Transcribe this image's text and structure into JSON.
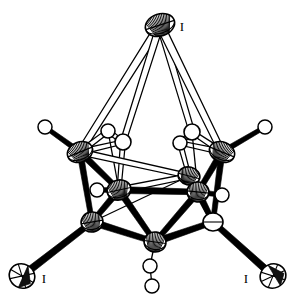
{
  "figure": {
    "background_color": "#ffffff",
    "line_color": "#000000",
    "width": 298,
    "height": 301
  },
  "labels": [
    {
      "id": "label-i-top",
      "text": "I",
      "x": 182,
      "y": 31
    },
    {
      "id": "label-i-bottom-left",
      "text": "I",
      "x": 44,
      "y": 283
    },
    {
      "id": "label-i-bottom-right",
      "text": "I",
      "x": 246,
      "y": 283
    }
  ],
  "atoms": [
    {
      "id": "I1",
      "element": "I",
      "kind": "ellipsoid",
      "x": 160,
      "y": 25,
      "rx": 15,
      "ry": 11,
      "rot": -18,
      "shade": "hatched"
    },
    {
      "id": "I2",
      "element": "I",
      "kind": "ellipsoid",
      "x": 22,
      "y": 276,
      "rx": 13,
      "ry": 12,
      "rot": 30,
      "shade": "quad"
    },
    {
      "id": "I3",
      "element": "I",
      "kind": "ellipsoid",
      "x": 273,
      "y": 276,
      "rx": 13,
      "ry": 12,
      "rot": -25,
      "shade": "quad"
    },
    {
      "id": "B1",
      "element": "B",
      "kind": "ellipsoid",
      "x": 80,
      "y": 152,
      "rx": 13,
      "ry": 10,
      "rot": -22,
      "shade": "hatched"
    },
    {
      "id": "B2",
      "element": "B",
      "kind": "ellipsoid",
      "x": 222,
      "y": 152,
      "rx": 13,
      "ry": 10,
      "rot": 22,
      "shade": "hatched"
    },
    {
      "id": "B3",
      "element": "B",
      "kind": "ellipsoid",
      "x": 119,
      "y": 190,
      "rx": 12,
      "ry": 10,
      "rot": -12,
      "shade": "hatched"
    },
    {
      "id": "B4",
      "element": "B",
      "kind": "ellipsoid",
      "x": 189,
      "y": 176,
      "rx": 11,
      "ry": 9,
      "rot": 14,
      "shade": "hatched"
    },
    {
      "id": "B5",
      "element": "B",
      "kind": "ellipsoid",
      "x": 198,
      "y": 192,
      "rx": 11,
      "ry": 10,
      "rot": 6,
      "shade": "hatched"
    },
    {
      "id": "B6",
      "element": "B",
      "kind": "ellipsoid",
      "x": 92,
      "y": 222,
      "rx": 11,
      "ry": 10,
      "rot": -10,
      "shade": "hatched"
    },
    {
      "id": "B7",
      "element": "B",
      "kind": "ellipsoid",
      "x": 155,
      "y": 242,
      "rx": 11,
      "ry": 10,
      "rot": 8,
      "shade": "hatched"
    },
    {
      "id": "B8",
      "element": "B",
      "kind": "ellipsoid",
      "x": 213,
      "y": 222,
      "rx": 10,
      "ry": 9,
      "rot": 0,
      "shade": "plain"
    },
    {
      "id": "B9",
      "element": "B",
      "kind": "open",
      "x": 108,
      "y": 131,
      "rx": 7,
      "ry": 7,
      "rot": 0,
      "shade": "none"
    },
    {
      "id": "B10",
      "element": "B",
      "kind": "open",
      "x": 123,
      "y": 142,
      "rx": 8,
      "ry": 8,
      "rot": 0,
      "shade": "none"
    },
    {
      "id": "B11",
      "element": "B",
      "kind": "open",
      "x": 192,
      "y": 132,
      "rx": 8,
      "ry": 8,
      "rot": 0,
      "shade": "none"
    },
    {
      "id": "B12",
      "element": "B",
      "kind": "open",
      "x": 180,
      "y": 143,
      "rx": 7,
      "ry": 7,
      "rot": 0,
      "shade": "none"
    },
    {
      "id": "H1",
      "element": "H",
      "kind": "open",
      "x": 45,
      "y": 127,
      "rx": 7,
      "ry": 7,
      "rot": 0,
      "shade": "none"
    },
    {
      "id": "H2",
      "element": "H",
      "kind": "open",
      "x": 265,
      "y": 127,
      "rx": 7,
      "ry": 7,
      "rot": 0,
      "shade": "none"
    },
    {
      "id": "H3",
      "element": "H",
      "kind": "open",
      "x": 97,
      "y": 190,
      "rx": 7,
      "ry": 7,
      "rot": 0,
      "shade": "none"
    },
    {
      "id": "H4",
      "element": "H",
      "kind": "open",
      "x": 222,
      "y": 195,
      "rx": 7,
      "ry": 7,
      "rot": 0,
      "shade": "none"
    },
    {
      "id": "H5",
      "element": "H",
      "kind": "open",
      "x": 150,
      "y": 266,
      "rx": 7,
      "ry": 7,
      "rot": 0,
      "shade": "none"
    },
    {
      "id": "H6",
      "element": "H",
      "kind": "open",
      "x": 152,
      "y": 286,
      "rx": 7,
      "ry": 7,
      "rot": 0,
      "shade": "none"
    }
  ],
  "bonds": [
    {
      "from": "I1",
      "to": "B1",
      "style": "open",
      "w": 4.0
    },
    {
      "from": "I1",
      "to": "B10",
      "style": "open",
      "w": 3.4
    },
    {
      "from": "I1",
      "to": "B11",
      "style": "open",
      "w": 3.4
    },
    {
      "from": "I1",
      "to": "B2",
      "style": "open",
      "w": 4.0
    },
    {
      "from": "I2",
      "to": "B6",
      "style": "solid",
      "w": 3.6
    },
    {
      "from": "I3",
      "to": "B8",
      "style": "solid",
      "w": 3.6
    },
    {
      "from": "B1",
      "to": "H1",
      "style": "solid",
      "w": 2.6
    },
    {
      "from": "B2",
      "to": "H2",
      "style": "solid",
      "w": 2.6
    },
    {
      "from": "B3",
      "to": "H3",
      "style": "solid",
      "w": 2.6
    },
    {
      "from": "B5",
      "to": "H4",
      "style": "solid",
      "w": 2.6
    },
    {
      "from": "B7",
      "to": "H5",
      "style": "thin",
      "w": 1.5
    },
    {
      "from": "H5",
      "to": "H6",
      "style": "thin",
      "w": 1.5
    },
    {
      "from": "B1",
      "to": "B9",
      "style": "open",
      "w": 2.6
    },
    {
      "from": "B1",
      "to": "B10",
      "style": "open",
      "w": 2.6
    },
    {
      "from": "B9",
      "to": "B10",
      "style": "open",
      "w": 2.4
    },
    {
      "from": "B2",
      "to": "B11",
      "style": "open",
      "w": 2.6
    },
    {
      "from": "B2",
      "to": "B12",
      "style": "open",
      "w": 2.6
    },
    {
      "from": "B11",
      "to": "B12",
      "style": "open",
      "w": 2.4
    },
    {
      "from": "B10",
      "to": "B3",
      "style": "open",
      "w": 2.4
    },
    {
      "from": "B12",
      "to": "B4",
      "style": "open",
      "w": 2.4
    },
    {
      "from": "B9",
      "to": "B3",
      "style": "thin",
      "w": 1.4
    },
    {
      "from": "B11",
      "to": "B5",
      "style": "thin",
      "w": 1.4
    },
    {
      "from": "B1",
      "to": "B3",
      "style": "solid",
      "w": 3.2
    },
    {
      "from": "B1",
      "to": "B6",
      "style": "solid",
      "w": 3.0
    },
    {
      "from": "B2",
      "to": "B5",
      "style": "solid",
      "w": 3.2
    },
    {
      "from": "B2",
      "to": "B8",
      "style": "solid",
      "w": 3.0
    },
    {
      "from": "B1",
      "to": "B4",
      "style": "open",
      "w": 3.0
    },
    {
      "from": "B3",
      "to": "B4",
      "style": "open",
      "w": 3.0
    },
    {
      "from": "B3",
      "to": "B5",
      "style": "solid",
      "w": 3.4
    },
    {
      "from": "B3",
      "to": "B6",
      "style": "solid",
      "w": 3.2
    },
    {
      "from": "B3",
      "to": "B7",
      "style": "solid",
      "w": 3.2
    },
    {
      "from": "B5",
      "to": "B7",
      "style": "solid",
      "w": 3.2
    },
    {
      "from": "B5",
      "to": "B8",
      "style": "solid",
      "w": 3.2
    },
    {
      "from": "B6",
      "to": "B7",
      "style": "solid",
      "w": 3.4
    },
    {
      "from": "B7",
      "to": "B8",
      "style": "solid",
      "w": 3.4
    },
    {
      "from": "B4",
      "to": "B5",
      "style": "thin",
      "w": 1.4
    },
    {
      "from": "B4",
      "to": "B8",
      "style": "solid",
      "w": 2.6
    },
    {
      "from": "B6",
      "to": "B4",
      "style": "thin",
      "w": 1.3
    }
  ]
}
